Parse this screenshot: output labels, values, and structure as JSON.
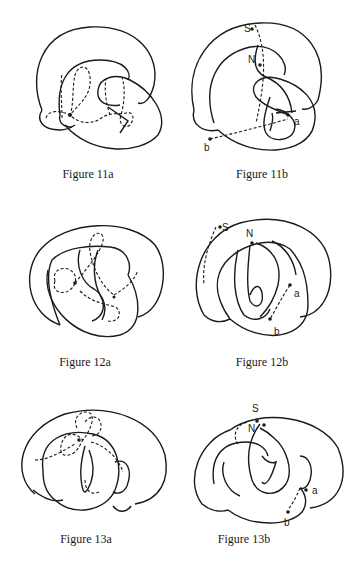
{
  "page": {
    "running_header": "SECTION 2 HEADER"
  },
  "figures": [
    {
      "id": "11a",
      "caption": "Figure 11a",
      "labels": []
    },
    {
      "id": "11b",
      "caption": "Figure 11b",
      "labels": [
        "S",
        "N",
        "a",
        "b"
      ]
    },
    {
      "id": "12a",
      "caption": "Figure 12a",
      "labels": []
    },
    {
      "id": "12b",
      "caption": "Figure 12b",
      "labels": [
        "S",
        "N",
        "a",
        "b"
      ]
    },
    {
      "id": "13a",
      "caption": "Figure 13a",
      "labels": []
    },
    {
      "id": "13b",
      "caption": "Figure 13b",
      "labels": [
        "S",
        "N",
        "a",
        "b"
      ]
    }
  ]
}
